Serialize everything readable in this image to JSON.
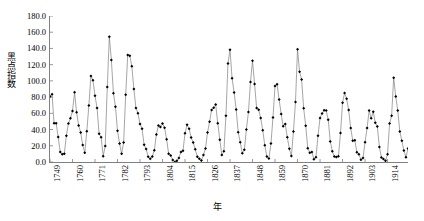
{
  "chart_data": {
    "type": "line",
    "title": "",
    "subtitle": "",
    "xlabel": "年",
    "ylabel": "黑点指数",
    "xlim": [
      1749,
      1924
    ],
    "ylim": [
      0.0,
      180.0
    ],
    "ytick_step": 20.0,
    "xtick_step": 11,
    "grid": false,
    "legend": null,
    "marker": "diamond",
    "line_color": "#7f7f7f",
    "marker_color": "#000000",
    "ytick_labels": [
      "0.0",
      "20.0",
      "40.0",
      "60.0",
      "80.0",
      "100.0",
      "120.0",
      "140.0",
      "160.0",
      "180.0"
    ],
    "ytick_values": [
      0,
      20,
      40,
      60,
      80,
      100,
      120,
      140,
      160,
      180
    ],
    "xtick_labels": [
      "1749",
      "1760",
      "1771",
      "1782",
      "1793",
      "1804",
      "1815",
      "1826",
      "1837",
      "1848",
      "1859",
      "1870",
      "1881",
      "1892",
      "1903",
      "1914"
    ],
    "xtick_values": [
      1749,
      1760,
      1771,
      1782,
      1793,
      1804,
      1815,
      1826,
      1837,
      1848,
      1859,
      1870,
      1881,
      1892,
      1903,
      1914
    ],
    "x": [
      1749,
      1750,
      1751,
      1752,
      1753,
      1754,
      1755,
      1756,
      1757,
      1758,
      1759,
      1760,
      1761,
      1762,
      1763,
      1764,
      1765,
      1766,
      1767,
      1768,
      1769,
      1770,
      1771,
      1772,
      1773,
      1774,
      1775,
      1776,
      1777,
      1778,
      1779,
      1780,
      1781,
      1782,
      1783,
      1784,
      1785,
      1786,
      1787,
      1788,
      1789,
      1790,
      1791,
      1792,
      1793,
      1794,
      1795,
      1796,
      1797,
      1798,
      1799,
      1800,
      1801,
      1802,
      1803,
      1804,
      1805,
      1806,
      1807,
      1808,
      1809,
      1810,
      1811,
      1812,
      1813,
      1814,
      1815,
      1816,
      1817,
      1818,
      1819,
      1820,
      1821,
      1822,
      1823,
      1824,
      1825,
      1826,
      1827,
      1828,
      1829,
      1830,
      1831,
      1832,
      1833,
      1834,
      1835,
      1836,
      1837,
      1838,
      1839,
      1840,
      1841,
      1842,
      1843,
      1844,
      1845,
      1846,
      1847,
      1848,
      1849,
      1850,
      1851,
      1852,
      1853,
      1854,
      1855,
      1856,
      1857,
      1858,
      1859,
      1860,
      1861,
      1862,
      1863,
      1864,
      1865,
      1866,
      1867,
      1868,
      1869,
      1870,
      1871,
      1872,
      1873,
      1874,
      1875,
      1876,
      1877,
      1878,
      1879,
      1880,
      1881,
      1882,
      1883,
      1884,
      1885,
      1886,
      1887,
      1888,
      1889,
      1890,
      1891,
      1892,
      1893,
      1894,
      1895,
      1896,
      1897,
      1898,
      1899,
      1900,
      1901,
      1902,
      1903,
      1904,
      1905,
      1906,
      1907,
      1908,
      1909,
      1910,
      1911,
      1912,
      1913,
      1914,
      1915,
      1916,
      1917,
      1918,
      1919,
      1920,
      1921,
      1922,
      1923,
      1924
    ],
    "values": [
      80.9,
      83.4,
      47.7,
      47.8,
      30.7,
      12.2,
      9.6,
      10.2,
      32.4,
      47.6,
      54.0,
      62.9,
      85.9,
      61.2,
      45.1,
      36.4,
      20.9,
      11.4,
      37.8,
      69.8,
      106.1,
      100.8,
      81.6,
      66.5,
      34.8,
      30.6,
      7.0,
      19.8,
      92.5,
      154.4,
      125.9,
      84.8,
      68.1,
      38.5,
      22.8,
      10.2,
      24.1,
      82.9,
      132.0,
      130.9,
      118.1,
      89.9,
      66.6,
      60.0,
      46.9,
      41.0,
      21.3,
      16.0,
      6.4,
      4.1,
      6.8,
      14.5,
      34.0,
      45.0,
      43.1,
      47.5,
      42.2,
      28.1,
      10.1,
      8.1,
      2.5,
      0.0,
      1.4,
      5.0,
      12.2,
      13.9,
      35.4,
      45.8,
      41.1,
      30.1,
      23.9,
      15.6,
      6.6,
      4.0,
      1.8,
      8.5,
      16.6,
      36.3,
      49.6,
      64.2,
      67.0,
      70.9,
      47.8,
      27.5,
      8.5,
      13.2,
      56.9,
      121.5,
      138.3,
      103.2,
      85.7,
      64.6,
      36.7,
      24.2,
      10.7,
      15.0,
      40.1,
      61.5,
      98.5,
      124.7,
      96.3,
      66.6,
      64.5,
      54.1,
      39.0,
      20.6,
      6.7,
      4.3,
      22.7,
      54.8,
      93.8,
      95.8,
      77.2,
      59.1,
      44.0,
      47.0,
      30.5,
      16.3,
      7.3,
      37.6,
      74.0,
      139.0,
      111.2,
      101.6,
      66.2,
      44.7,
      17.0,
      11.3,
      12.4,
      3.4,
      6.0,
      32.3,
      54.3,
      59.7,
      63.7,
      63.5,
      52.2,
      25.4,
      13.1,
      6.8,
      6.3,
      7.1,
      35.6,
      73.0,
      85.1,
      78.0,
      64.0,
      41.8,
      26.2,
      26.7,
      12.1,
      9.5,
      2.7,
      5.0,
      24.4,
      42.0,
      63.5,
      53.8,
      62.0,
      48.5,
      43.9,
      18.6,
      5.7,
      3.6,
      1.4,
      9.6,
      47.4,
      57.1,
      103.9,
      80.6,
      63.6,
      37.6,
      26.1,
      14.2,
      5.8,
      16.7
    ]
  },
  "axis": {
    "y_title": "黑点指数",
    "x_title": "年"
  }
}
